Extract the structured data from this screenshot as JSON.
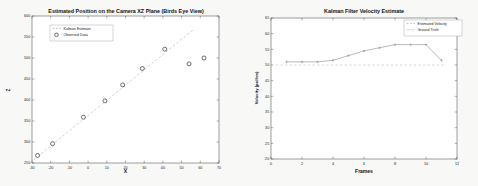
{
  "page": {
    "background": "#f8f8f6"
  },
  "chart_data": [
    {
      "type": "scatter",
      "title": "Estimated Position on the Camera XZ Plane (Birds Eye View)",
      "xlabel": "X",
      "ylabel": "Z",
      "xlim": [
        -30,
        70
      ],
      "ylim": [
        250,
        600
      ],
      "xticks": [
        -30,
        -20,
        -10,
        0,
        10,
        20,
        30,
        40,
        50,
        60,
        70
      ],
      "yticks": [
        250,
        300,
        350,
        400,
        450,
        500,
        550,
        600
      ],
      "grid": false,
      "legend_position": "top-left",
      "legend": [
        {
          "label": "Kalman Estimate",
          "style": "dashed-line"
        },
        {
          "label": "Observed Data",
          "style": "circle-marker"
        }
      ],
      "series": [
        {
          "name": "Kalman Estimate",
          "type": "line",
          "dashed": true,
          "color": "#bdbdbd",
          "points": [
            [
              -29,
              258
            ],
            [
              56.5,
              568
            ]
          ]
        },
        {
          "name": "Observed Data",
          "type": "scatter",
          "marker": "circle",
          "color": "#4a4a4a",
          "points": [
            [
              -27,
              268
            ],
            [
              -19,
              296
            ],
            [
              -2.5,
              359
            ],
            [
              9,
              398
            ],
            [
              18.5,
              436
            ],
            [
              29,
              475
            ],
            [
              41,
              521
            ],
            [
              54,
              486
            ],
            [
              62,
              500
            ]
          ]
        }
      ]
    },
    {
      "type": "line",
      "title": "Kalman Filter Velocity Estimate",
      "xlabel": "Frames",
      "ylabel": "Velocity (px/frm)",
      "xlim": [
        0,
        12
      ],
      "ylim": [
        20,
        65
      ],
      "xticks": [
        0,
        2,
        4,
        6,
        8,
        10,
        12
      ],
      "yticks": [
        20,
        25,
        30,
        35,
        40,
        45,
        50,
        55,
        60,
        65
      ],
      "grid": false,
      "legend_position": "top-right",
      "legend": [
        {
          "label": "Estimated Velocity",
          "style": "dash-dot-marker"
        },
        {
          "label": "Ground Truth",
          "style": "faint-line"
        }
      ],
      "series": [
        {
          "name": "Estimated Velocity",
          "type": "line-marker",
          "marker": "plus",
          "color": "#9c9c9c",
          "points": [
            [
              1,
              51
            ],
            [
              2,
              51
            ],
            [
              3,
              51
            ],
            [
              4,
              51.5
            ],
            [
              5,
              53
            ],
            [
              6,
              54.5
            ],
            [
              7,
              55.5
            ],
            [
              8,
              56.5
            ],
            [
              9,
              56.5
            ],
            [
              10,
              56.5
            ],
            [
              11,
              51.5
            ]
          ]
        },
        {
          "name": "Ground Truth",
          "type": "line",
          "dashed": true,
          "color": "#c9c9c9",
          "points": [
            [
              0.3,
              50
            ],
            [
              11.3,
              50
            ]
          ]
        }
      ]
    }
  ]
}
